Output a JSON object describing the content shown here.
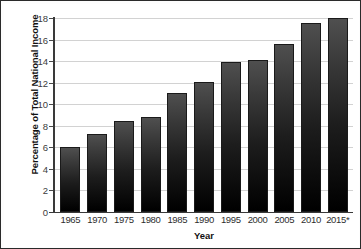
{
  "chart_data": {
    "type": "bar",
    "title": "",
    "xlabel": "Year",
    "ylabel": "Percentage of Total National Income",
    "categories": [
      "1965",
      "1970",
      "1975",
      "1980",
      "1985",
      "1990",
      "1995",
      "2000",
      "2005",
      "2010",
      "2015*"
    ],
    "values": [
      6.0,
      7.2,
      8.4,
      8.8,
      11.0,
      12.1,
      13.9,
      14.1,
      15.6,
      17.5,
      18.0
    ],
    "ylim": [
      0,
      18
    ],
    "yticks": [
      0,
      2,
      4,
      6,
      8,
      10,
      12,
      14,
      16,
      18
    ],
    "ytick_labels": [
      "0",
      "2",
      "4",
      "6",
      "8",
      "10",
      "12",
      "14",
      "16",
      "18"
    ],
    "grid": true,
    "legend": false,
    "bar_color_top": "#4f4f4f",
    "bar_color_bottom": "#000000",
    "gridline_color": "#d2d2d2",
    "axis_color": "#3a3a3a",
    "background": "#ffffff"
  }
}
